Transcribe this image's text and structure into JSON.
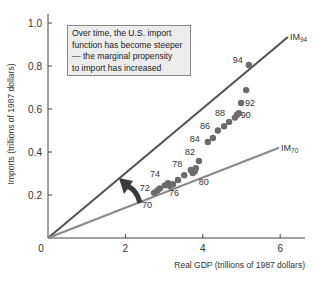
{
  "chart_data": {
    "type": "scatter",
    "title": "",
    "xlabel": "Real GDP (trillions of 1987 dollars)",
    "ylabel": "Imports (trillions of 1987 dollars)",
    "xlim": [
      0,
      6.5
    ],
    "ylim": [
      0,
      1.0
    ],
    "x_ticks": [
      "0",
      "2",
      "4",
      "6"
    ],
    "y_ticks": [
      "0.2",
      "0.4",
      "0.6",
      "0.8",
      "1.0"
    ],
    "origin_label": "0",
    "grid": false,
    "annotation": "Over time, the U.S. import function has become steeper — the marginal propensity to import has increased",
    "annotation_lines": [
      "Over time, the U.S. import",
      "function has become steeper",
      "— the marginal propensity",
      "to import has increased"
    ],
    "lines": [
      {
        "name": "IM94",
        "label_main": "IM",
        "label_sub": "94",
        "x": [
          0,
          6.2
        ],
        "y": [
          0,
          0.935
        ],
        "color": "#555555"
      },
      {
        "name": "IM70",
        "label_main": "IM",
        "label_sub": "70",
        "x": [
          0,
          5.97
        ],
        "y": [
          0,
          0.42
        ],
        "color": "#8a8a8a"
      }
    ],
    "series": [
      {
        "name": "U.S. imports vs real GDP, 1970–1994",
        "points": [
          {
            "year": "70",
            "x": 2.74,
            "y": 0.21,
            "label": "70"
          },
          {
            "year": "71",
            "x": 2.82,
            "y": 0.22,
            "label": ""
          },
          {
            "year": "72",
            "x": 2.89,
            "y": 0.23,
            "label": "72"
          },
          {
            "year": "73",
            "x": 3.02,
            "y": 0.245,
            "label": ""
          },
          {
            "year": "74",
            "x": 3.1,
            "y": 0.255,
            "label": "74"
          },
          {
            "year": "75",
            "x": 3.15,
            "y": 0.242,
            "label": ""
          },
          {
            "year": "76",
            "x": 3.23,
            "y": 0.25,
            "label": "76"
          },
          {
            "year": "77",
            "x": 3.36,
            "y": 0.27,
            "label": ""
          },
          {
            "year": "78",
            "x": 3.52,
            "y": 0.292,
            "label": "78"
          },
          {
            "year": "79",
            "x": 3.69,
            "y": 0.316,
            "label": ""
          },
          {
            "year": "80",
            "x": 3.74,
            "y": 0.302,
            "label": "80"
          },
          {
            "year": "81",
            "x": 3.79,
            "y": 0.31,
            "label": ""
          },
          {
            "year": "82",
            "x": 3.9,
            "y": 0.358,
            "label": "82"
          },
          {
            "year": "83",
            "x": 3.82,
            "y": 0.325,
            "label": ""
          },
          {
            "year": "84",
            "x": 4.13,
            "y": 0.447,
            "label": "84"
          },
          {
            "year": "85",
            "x": 4.26,
            "y": 0.465,
            "label": ""
          },
          {
            "year": "86",
            "x": 4.39,
            "y": 0.5,
            "label": "86"
          },
          {
            "year": "87",
            "x": 4.55,
            "y": 0.52,
            "label": ""
          },
          {
            "year": "88",
            "x": 4.68,
            "y": 0.54,
            "label": "88"
          },
          {
            "year": "89",
            "x": 4.83,
            "y": 0.56,
            "label": ""
          },
          {
            "year": "90",
            "x": 4.88,
            "y": 0.572,
            "label": "90"
          },
          {
            "year": "91",
            "x": 4.93,
            "y": 0.58,
            "label": ""
          },
          {
            "year": "92",
            "x": 4.99,
            "y": 0.628,
            "label": "92"
          },
          {
            "year": "93",
            "x": 5.12,
            "y": 0.688,
            "label": ""
          },
          {
            "year": "94",
            "x": 5.19,
            "y": 0.805,
            "label": "94"
          }
        ]
      }
    ],
    "arrow": {
      "description": "curved arrow indicating rotation from IM70 toward IM94",
      "direction": "counter-clockwise"
    }
  }
}
